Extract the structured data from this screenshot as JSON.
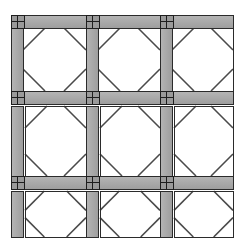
{
  "figure": {
    "name": "braced-frame-grid",
    "background_color": "#ffffff",
    "member_fill": "#a8a8a8",
    "member_fill_light": "#b4b4b4",
    "member_stroke": "#2b2b2b",
    "brace_stroke": "#4a4a4a",
    "joint_plate_fill": "#9a9a9a",
    "joint_line_color": "#1e1e1e",
    "opening_fill": "#ffffff"
  },
  "canvas": {
    "width": 241,
    "height": 252,
    "content_left": 11,
    "content_right": 233,
    "content_top": 15,
    "content_bottom": 237
  },
  "grid": {
    "columns": 3,
    "rows": 3,
    "column_labels": [
      "bay-1",
      "bay-2",
      "bay-3"
    ],
    "row_labels": [
      "storey-3",
      "storey-2",
      "storey-1"
    ],
    "column_x": [
      11,
      86,
      160
    ],
    "column_width": 12,
    "bay_x_spans": [
      [
        11,
        86
      ],
      [
        86,
        160
      ],
      [
        160,
        233
      ]
    ],
    "row_y_spans": [
      [
        15,
        104
      ],
      [
        104,
        176
      ],
      [
        176,
        237
      ]
    ],
    "beam_thickness": 13,
    "beam_rows_y": [
      15,
      104,
      176
    ],
    "joint_size": 13
  },
  "members": {
    "beams": [
      {
        "id": "beam-top-1",
        "x": 11,
        "y": 15,
        "w": 222,
        "h": 13,
        "row": "storey-3-top"
      },
      {
        "id": "beam-mid-1",
        "x": 11,
        "y": 91,
        "w": 222,
        "h": 13,
        "row": "storey-3-bottom"
      },
      {
        "id": "beam-mid-2",
        "x": 11,
        "y": 176,
        "w": 222,
        "h": 13,
        "row": "storey-2-bottom"
      }
    ],
    "columns": [
      {
        "id": "col-left-r1",
        "x": 11,
        "y": 15,
        "w": 12,
        "h": 89,
        "row": "storey-3"
      },
      {
        "id": "col-mid1-r1",
        "x": 86,
        "y": 15,
        "w": 12,
        "h": 89,
        "row": "storey-3"
      },
      {
        "id": "col-mid2-r1",
        "x": 160,
        "y": 15,
        "w": 12,
        "h": 89,
        "row": "storey-3"
      },
      {
        "id": "col-left-r2",
        "x": 11,
        "y": 106,
        "w": 12,
        "h": 70,
        "row": "storey-2"
      },
      {
        "id": "col-mid1-r2",
        "x": 86,
        "y": 106,
        "w": 12,
        "h": 70,
        "row": "storey-2"
      },
      {
        "id": "col-mid2-r2",
        "x": 160,
        "y": 106,
        "w": 12,
        "h": 70,
        "row": "storey-2"
      },
      {
        "id": "col-left-r3",
        "x": 11,
        "y": 191,
        "w": 12,
        "h": 46,
        "row": "storey-1"
      },
      {
        "id": "col-mid1-r3",
        "x": 86,
        "y": 191,
        "w": 12,
        "h": 46,
        "row": "storey-1"
      },
      {
        "id": "col-mid2-r3",
        "x": 160,
        "y": 191,
        "w": 12,
        "h": 46,
        "row": "storey-1"
      }
    ],
    "joints": [
      {
        "id": "joint-r1-c1",
        "x": 11,
        "y": 15
      },
      {
        "id": "joint-r1-c2",
        "x": 86,
        "y": 15
      },
      {
        "id": "joint-r1-c3",
        "x": 160,
        "y": 15
      },
      {
        "id": "joint-r2-c1",
        "x": 11,
        "y": 91
      },
      {
        "id": "joint-r2-c2",
        "x": 86,
        "y": 91
      },
      {
        "id": "joint-r2-c3",
        "x": 160,
        "y": 91
      },
      {
        "id": "joint-r3-c1",
        "x": 11,
        "y": 176
      },
      {
        "id": "joint-r3-c2",
        "x": 86,
        "y": 176
      },
      {
        "id": "joint-r3-c3",
        "x": 160,
        "y": 176
      }
    ]
  },
  "bays": [
    {
      "id": "bay-r1-c1",
      "x0": 23,
      "y0": 28,
      "x1": 86,
      "y1": 91,
      "brace_inset": 22,
      "row": 1,
      "col": 1
    },
    {
      "id": "bay-r1-c2",
      "x0": 98,
      "y0": 28,
      "x1": 160,
      "y1": 91,
      "brace_inset": 22,
      "row": 1,
      "col": 2
    },
    {
      "id": "bay-r1-c3",
      "x0": 172,
      "y0": 28,
      "x1": 233,
      "y1": 91,
      "brace_inset": 22,
      "row": 1,
      "col": 3
    },
    {
      "id": "bay-r2-c1",
      "x0": 25,
      "y0": 106,
      "x1": 86,
      "y1": 176,
      "brace_inset": 22,
      "row": 2,
      "col": 1
    },
    {
      "id": "bay-r2-c2",
      "x0": 100,
      "y0": 106,
      "x1": 160,
      "y1": 176,
      "brace_inset": 22,
      "row": 2,
      "col": 2
    },
    {
      "id": "bay-r2-c3",
      "x0": 174,
      "y0": 106,
      "x1": 233,
      "y1": 176,
      "brace_inset": 22,
      "row": 2,
      "col": 3
    },
    {
      "id": "bay-r3-c1",
      "x0": 25,
      "y0": 191,
      "x1": 86,
      "y1": 237,
      "brace_inset": 22,
      "row": 3,
      "col": 1
    },
    {
      "id": "bay-r3-c2",
      "x0": 100,
      "y0": 191,
      "x1": 160,
      "y1": 237,
      "brace_inset": 22,
      "row": 3,
      "col": 2
    },
    {
      "id": "bay-r3-c3",
      "x0": 174,
      "y0": 191,
      "x1": 233,
      "y1": 237,
      "brace_inset": 22,
      "row": 3,
      "col": 3
    }
  ],
  "labels": {
    "none_visible": ""
  }
}
